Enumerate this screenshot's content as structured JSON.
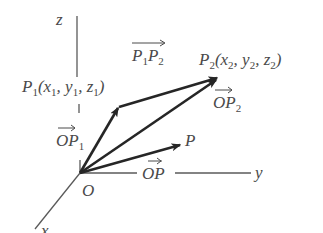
{
  "diagram": {
    "type": "3d-vector-diagram",
    "colors": {
      "axis": "#5a5a5a",
      "vector": "#262626",
      "text": "#4a4a4a",
      "background": "#ffffff"
    },
    "axes": {
      "z": {
        "label": "z"
      },
      "y": {
        "label": "y"
      },
      "x": {
        "label": "x"
      }
    },
    "origin": {
      "label": "O"
    },
    "points": {
      "p1": {
        "name": "P",
        "sub": "1",
        "coords": {
          "open": "(",
          "x": "x",
          "x_sub": "1",
          "sep1": ", ",
          "y": "y",
          "y_sub": "1",
          "sep2": ", ",
          "z": "z",
          "z_sub": "1",
          "close": ")"
        }
      },
      "p2": {
        "name": "P",
        "sub": "2",
        "coords": {
          "open": "(",
          "x": "x",
          "x_sub": "2",
          "sep1": ", ",
          "y": "y",
          "y_sub": "2",
          "sep2": ", ",
          "z": "z",
          "z_sub": "2",
          "close": ")"
        }
      },
      "p": {
        "name": "P"
      }
    },
    "vectors": {
      "op1": {
        "main": "OP",
        "sub": "1"
      },
      "op2": {
        "main": "OP",
        "sub": "2"
      },
      "op": {
        "main": "OP"
      },
      "p1p2": {
        "a": "P",
        "a_sub": "1",
        "b": "P",
        "b_sub": "2"
      }
    }
  }
}
